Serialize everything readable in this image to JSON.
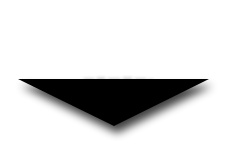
{
  "canvas": {
    "width": 241,
    "height": 168,
    "background": "#ffffff"
  },
  "arrow": {
    "icon": "down-triangle-arrow-icon",
    "fill": "#000000",
    "shadow_color": "#555555",
    "points": {
      "top_left": [
        18,
        79
      ],
      "top_right": [
        209,
        79
      ],
      "apex": [
        114,
        126
      ]
    }
  },
  "ghost_marks": {
    "color": "#9a9a9a"
  }
}
